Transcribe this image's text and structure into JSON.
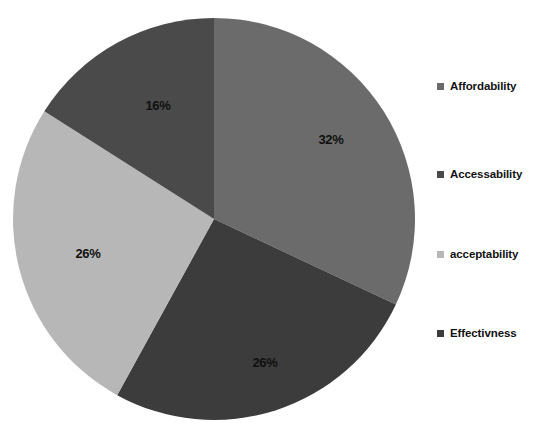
{
  "chart_data": {
    "type": "pie",
    "title": "",
    "subtitle": "",
    "xlabel": "",
    "ylabel": "",
    "legend_position": "right",
    "grid": false,
    "start_angle_deg": 0,
    "direction": "clockwise",
    "categories": [
      "Affordability",
      "Accessability",
      "acceptability",
      "Effectivness"
    ],
    "values": [
      32,
      26,
      26,
      16
    ],
    "value_unit": "%",
    "slices": [
      {
        "label": "Affordability",
        "value": 32,
        "data_label": "32%",
        "color": "#6b6b6b",
        "start_deg": 0,
        "end_deg": 115.2,
        "label_x": 331,
        "label_y": 141
      },
      {
        "label": "Effectivness",
        "value": 26,
        "data_label": "26%",
        "color": "#3c3c3c",
        "start_deg": 115.2,
        "end_deg": 208.8,
        "label_x": 265,
        "label_y": 364
      },
      {
        "label": "acceptability",
        "value": 26,
        "data_label": "26%",
        "color": "#b7b7b7",
        "start_deg": 208.8,
        "end_deg": 302.4,
        "label_x": 88,
        "label_y": 255
      },
      {
        "label": "Accessability",
        "value": 16,
        "data_label": "16%",
        "color": "#4a4a4a",
        "start_deg": 302.4,
        "end_deg": 360,
        "label_x": 158,
        "label_y": 107
      }
    ],
    "geometry": {
      "center_x": 214,
      "center_y": 219,
      "radius": 201
    }
  },
  "legend": {
    "items": [
      {
        "label": "Affordability",
        "color": "#6b6b6b",
        "top": 80
      },
      {
        "label": "Accessability",
        "color": "#4a4a4a",
        "top": 168
      },
      {
        "label": "acceptability",
        "color": "#b7b7b7",
        "top": 248
      },
      {
        "label": "Effectivness",
        "color": "#3c3c3c",
        "top": 327
      }
    ]
  },
  "colors": {
    "background": "#ffffff",
    "label_text": "#101010",
    "legend_text": "#121212"
  }
}
